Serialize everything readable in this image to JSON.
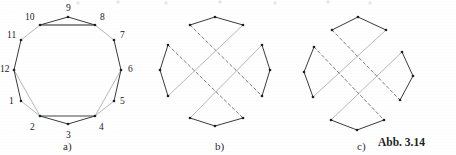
{
  "figure": {
    "caption": "Abb. 3.14",
    "panels": [
      {
        "id": "a",
        "label": "a)",
        "label_x": 63,
        "label_y": 150
      },
      {
        "id": "b",
        "label": "b)",
        "label_x": 215,
        "label_y": 150
      },
      {
        "id": "c",
        "label": "c)",
        "label_x": 357,
        "label_y": 150
      }
    ],
    "style": {
      "ink": "#3a3a3a",
      "ink_light": "#b8b8b8",
      "ink_dash": "#6e6e6e",
      "vertex": "#1f1f1f",
      "paper": "#ffffff"
    }
  },
  "panel_a": {
    "name": "dodecagon-with-crossing-chords",
    "vertex_labels": [
      "1",
      "2",
      "3",
      "4",
      "5",
      "6",
      "7",
      "8",
      "9",
      "10",
      "11",
      "12"
    ],
    "vertices": [
      {
        "label": "1",
        "x": 21,
        "y": 101,
        "lx": 9,
        "ly": 104
      },
      {
        "label": "2",
        "x": 40,
        "y": 116,
        "lx": 30,
        "ly": 130
      },
      {
        "label": "3",
        "x": 68,
        "y": 124,
        "lx": 66,
        "ly": 138
      },
      {
        "label": "4",
        "x": 95,
        "y": 116,
        "lx": 99,
        "ly": 130
      },
      {
        "label": "5",
        "x": 114,
        "y": 101,
        "lx": 120,
        "ly": 104
      },
      {
        "label": "6",
        "x": 121,
        "y": 70,
        "lx": 128,
        "ly": 72
      },
      {
        "label": "7",
        "x": 114,
        "y": 40,
        "lx": 120,
        "ly": 38
      },
      {
        "label": "8",
        "x": 95,
        "y": 25,
        "lx": 100,
        "ly": 20
      },
      {
        "label": "9",
        "x": 68,
        "y": 17,
        "lx": 66,
        "ly": 11
      },
      {
        "label": "10",
        "x": 40,
        "y": 25,
        "lx": 25,
        "ly": 20
      },
      {
        "label": "11",
        "x": 21,
        "y": 40,
        "lx": 7,
        "ly": 38
      },
      {
        "label": "12",
        "x": 14,
        "y": 70,
        "lx": 0,
        "ly": 72
      }
    ],
    "dark_edges": [
      [
        "11",
        "12"
      ],
      [
        "12",
        "1"
      ],
      [
        "6",
        "7"
      ],
      [
        "5",
        "6"
      ],
      [
        "10",
        "9"
      ],
      [
        "9",
        "8"
      ],
      [
        "2",
        "3"
      ],
      [
        "3",
        "4"
      ]
    ],
    "light_edges": [
      [
        "1",
        "2"
      ],
      [
        "4",
        "5"
      ],
      [
        "7",
        "8"
      ],
      [
        "10",
        "11"
      ],
      [
        "2",
        "12"
      ],
      [
        "4",
        "6"
      ],
      [
        "8",
        "10"
      ]
    ],
    "crossing_chords": [
      [
        "10",
        "8"
      ],
      [
        "2",
        "4"
      ]
    ]
  },
  "panel_b": {
    "name": "four-arc-star-configuration",
    "cx": 215,
    "cy": 72,
    "rotation_deg": 0,
    "arcs": [
      {
        "points": [
          [
            190,
            25
          ],
          [
            215,
            17
          ],
          [
            243,
            25
          ]
        ]
      },
      {
        "points": [
          [
            262,
            45
          ],
          [
            270,
            70
          ],
          [
            262,
            96
          ]
        ]
      },
      {
        "points": [
          [
            243,
            118
          ],
          [
            215,
            126
          ],
          [
            190,
            118
          ]
        ]
      },
      {
        "points": [
          [
            168,
            96
          ],
          [
            160,
            70
          ],
          [
            168,
            45
          ]
        ]
      }
    ],
    "dashed_chords": [
      [
        [
          190,
          25
        ],
        [
          262,
          96
        ]
      ],
      [
        [
          168,
          45
        ],
        [
          243,
          118
        ]
      ]
    ],
    "light_chords": [
      [
        [
          243,
          25
        ],
        [
          168,
          96
        ]
      ],
      [
        [
          262,
          45
        ],
        [
          190,
          118
        ]
      ]
    ]
  },
  "panel_c": {
    "name": "rotated-four-arc-star-configuration",
    "cx": 358,
    "cy": 72,
    "rotation_deg": 18,
    "arcs": [
      {
        "points": [
          [
            332,
            30
          ],
          [
            358,
            17
          ],
          [
            386,
            30
          ]
        ]
      },
      {
        "points": [
          [
            402,
            52
          ],
          [
            413,
            76
          ],
          [
            400,
            100
          ]
        ]
      },
      {
        "points": [
          [
            384,
            120
          ],
          [
            357,
            130
          ],
          [
            331,
            120
          ]
        ]
      },
      {
        "points": [
          [
            313,
            97
          ],
          [
            304,
            72
          ],
          [
            314,
            47
          ]
        ]
      }
    ],
    "dashed_chords": [
      [
        [
          332,
          30
        ],
        [
          400,
          100
        ]
      ],
      [
        [
          314,
          47
        ],
        [
          384,
          120
        ]
      ]
    ],
    "light_chords": [
      [
        [
          386,
          30
        ],
        [
          313,
          97
        ]
      ],
      [
        [
          402,
          52
        ],
        [
          331,
          120
        ]
      ]
    ]
  }
}
